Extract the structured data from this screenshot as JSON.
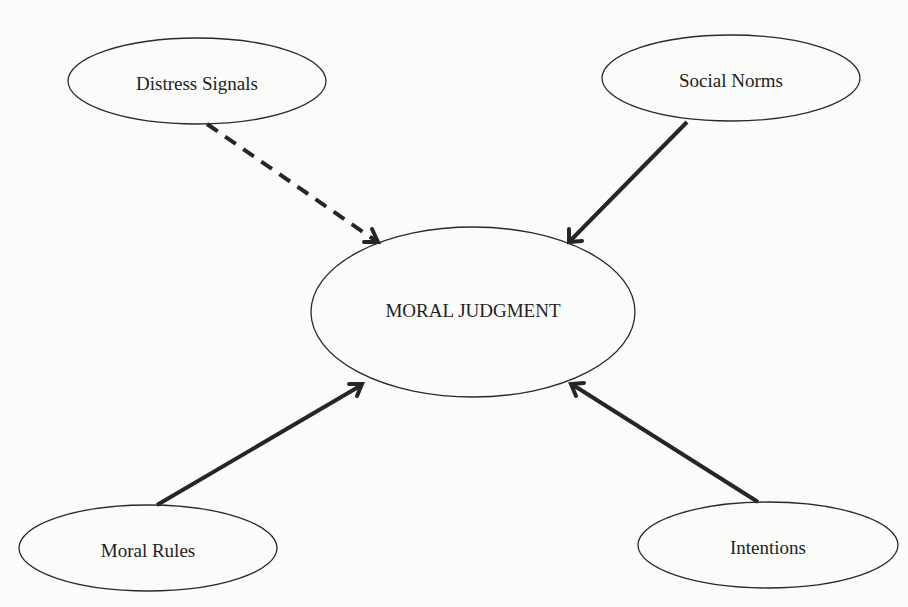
{
  "diagram": {
    "title": "",
    "center_node": {
      "id": "moral-judgment",
      "label": "MORAL JUDGMENT"
    },
    "nodes": [
      {
        "id": "distress-signals",
        "label": "Distress Signals",
        "position": "top-left"
      },
      {
        "id": "social-norms",
        "label": "Social Norms",
        "position": "top-right"
      },
      {
        "id": "moral-rules",
        "label": "Moral Rules",
        "position": "bottom-left"
      },
      {
        "id": "intentions",
        "label": "Intentions",
        "position": "bottom-right"
      }
    ],
    "edges": [
      {
        "from": "distress-signals",
        "to": "moral-judgment",
        "style": "dashed",
        "arrow": "end"
      },
      {
        "from": "social-norms",
        "to": "moral-judgment",
        "style": "solid",
        "arrow": "end"
      },
      {
        "from": "moral-rules",
        "to": "moral-judgment",
        "style": "solid",
        "arrow": "end"
      },
      {
        "from": "intentions",
        "to": "moral-judgment",
        "style": "solid",
        "arrow": "end"
      }
    ],
    "colors": {
      "background": "#fbfbfa",
      "stroke": "#262626",
      "text": "#222222"
    }
  }
}
